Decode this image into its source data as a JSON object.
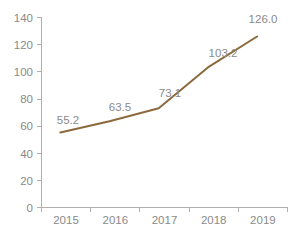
{
  "chart_data": {
    "type": "line",
    "title": "",
    "subtitle": "",
    "xlabel": "",
    "ylabel": "",
    "categories": [
      "2015",
      "2016",
      "2017",
      "2018",
      "2019"
    ],
    "values": [
      55.2,
      63.5,
      73.1,
      103.2,
      126.0
    ],
    "data_labels": [
      "55.2",
      "63.5",
      "73.1",
      "103.2",
      "126.0"
    ],
    "series": [
      {
        "name": "",
        "values": [
          55.2,
          63.5,
          73.1,
          103.2,
          126.0
        ],
        "color": "#8b6a3c",
        "markers": false
      }
    ],
    "ylim": [
      0,
      140
    ],
    "ytick_step": 20,
    "ytick_labels": [
      "0",
      "20",
      "40",
      "60",
      "80",
      "100",
      "120",
      "140"
    ],
    "ytick_values": [
      0,
      20,
      40,
      60,
      80,
      100,
      120,
      140
    ],
    "xtick_labels": [
      "2015",
      "2016",
      "2017",
      "2018",
      "2019"
    ],
    "grid": false,
    "legend": false,
    "legend_position": "none",
    "annotations": []
  },
  "style": {
    "line_color": "#8b6a3c",
    "axis_color": "#b0b0b0",
    "text_color": "#8a8a8a",
    "background": "#ffffff"
  }
}
